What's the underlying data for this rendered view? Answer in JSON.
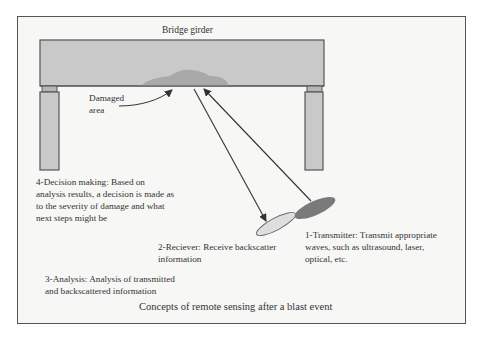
{
  "figure": {
    "caption": "Concepts of remote sensing after a blast event",
    "labels": {
      "girder": "Bridge girder",
      "damaged_line1": "Damaged",
      "damaged_line2": "area"
    },
    "steps": [
      {
        "id": 1,
        "lines": [
          "1-Transmitter: Transmit appropriate",
          "waves, such as ultrasound, laser,",
          "optical, etc."
        ]
      },
      {
        "id": 2,
        "lines": [
          "2-Reciever: Receive backscatter",
          "information"
        ]
      },
      {
        "id": 3,
        "lines": [
          "3-Analysis: Analysis of transmitted",
          "and backscattered information"
        ]
      },
      {
        "id": 4,
        "lines": [
          "4-Decision making: Based on",
          "analysis results, a decision is made as",
          "to the severity of damage and what",
          "next steps might be"
        ]
      }
    ],
    "colors": {
      "girder_fill": "#c9c9c9",
      "damage_fill": "#a9a9a9",
      "column_fill": "#c9c9c9",
      "outline": "#555555",
      "receiver_fill": "#dedede",
      "transmitter_fill": "#7a7a7a",
      "frame_bg": "#f7f7f5"
    }
  }
}
